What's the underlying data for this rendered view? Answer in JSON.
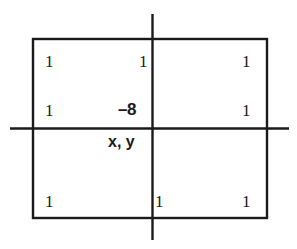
{
  "figure": {
    "type": "finite-difference-stencil",
    "background_color": "#ffffff",
    "line_color": "#1a1a1a",
    "text_color": "#1a1a1a"
  },
  "axes": {
    "horizontal": {
      "name": "x-axis",
      "y": 128,
      "x_start": 10,
      "x_end": 289
    },
    "vertical": {
      "name": "y-axis",
      "x": 152,
      "y_start": 14,
      "y_end": 240
    },
    "origin": {
      "x": 152,
      "y": 128
    }
  },
  "rectangle": {
    "left": 32,
    "top": 38,
    "right": 268,
    "bottom": 219
  },
  "center_point": {
    "coefficient": "–8",
    "label": "x, y"
  },
  "nodes": [
    {
      "id": "top-left",
      "value": "1",
      "x": 45,
      "y": 53
    },
    {
      "id": "top-center-left",
      "value": "1",
      "x": 139,
      "y": 53
    },
    {
      "id": "top-right",
      "value": "1",
      "x": 242,
      "y": 53
    },
    {
      "id": "middle-left",
      "value": "1",
      "x": 45,
      "y": 102
    },
    {
      "id": "middle-right",
      "value": "1",
      "x": 242,
      "y": 102
    },
    {
      "id": "bottom-left",
      "value": "1",
      "x": 45,
      "y": 193
    },
    {
      "id": "bottom-center",
      "value": "1",
      "x": 155,
      "y": 193
    },
    {
      "id": "bottom-right",
      "value": "1",
      "x": 242,
      "y": 193
    }
  ],
  "center_coef_pos": {
    "x": 118,
    "y": 101
  },
  "point_label_pos": {
    "x": 108,
    "y": 134
  }
}
